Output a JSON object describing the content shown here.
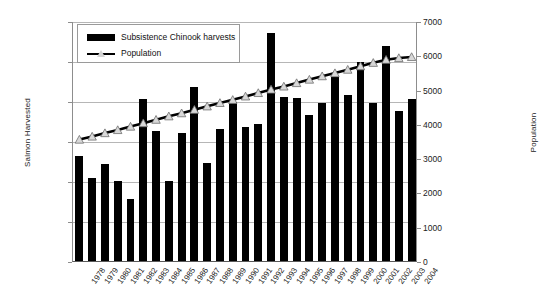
{
  "chart_data": {
    "type": "bar",
    "title": "",
    "subtitle": "",
    "xlabel": "",
    "ylabel": "Salmon Harvested",
    "ylabel_secondary": "Population",
    "ylim": [
      0,
      30000
    ],
    "ylim_secondary": [
      0,
      7000
    ],
    "yticks": [
      0,
      5000,
      10000,
      15000,
      20000,
      25000,
      30000
    ],
    "yticks_secondary": [
      0,
      1000,
      2000,
      3000,
      4000,
      5000,
      6000,
      7000
    ],
    "grid": true,
    "legend_position": "top-left",
    "categories": [
      "1978",
      "1979",
      "1980",
      "1981",
      "1982",
      "1983",
      "1984",
      "1985",
      "1986",
      "1987",
      "1988",
      "1989",
      "1990",
      "1991",
      "1992",
      "1993",
      "1994",
      "1995",
      "1996",
      "1997",
      "1998",
      "1999",
      "2000",
      "2001",
      "2002",
      "2003",
      "2004"
    ],
    "series": [
      {
        "name": "Subsistence Chinook harvests",
        "type": "bar",
        "axis": "left",
        "color": "#000000",
        "values": [
          13100,
          10400,
          12100,
          10000,
          7800,
          20200,
          16200,
          10000,
          16000,
          21800,
          12200,
          16500,
          19900,
          16800,
          17100,
          28500,
          20500,
          20400,
          18300,
          19800,
          23000,
          20800,
          24900,
          19700,
          26900,
          18700,
          20200
        ]
      },
      {
        "name": "Population",
        "type": "line",
        "axis": "right",
        "color": "#000000",
        "marker": "triangle",
        "values": [
          3570,
          3660,
          3760,
          3850,
          3950,
          4050,
          4150,
          4250,
          4340,
          4440,
          4540,
          4640,
          4730,
          4830,
          4930,
          5030,
          5120,
          5220,
          5320,
          5420,
          5510,
          5610,
          5710,
          5810,
          5900,
          5950,
          5980
        ]
      }
    ]
  },
  "legend": {
    "entries": [
      {
        "label": "Subsistence Chinook harvests",
        "swatch": "bar"
      },
      {
        "label": "Population",
        "swatch": "line-triangle"
      }
    ]
  }
}
